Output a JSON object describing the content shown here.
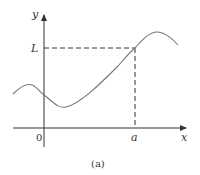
{
  "figure": {
    "caption": "(a)",
    "axes": {
      "x_label": "x",
      "y_label": "y",
      "origin_label": "0"
    },
    "marked_point": {
      "x_label": "a",
      "y_label": "L"
    },
    "colors": {
      "axis": "#333333",
      "curve": "#777777",
      "dashed": "#333333",
      "background": "#ffffff"
    }
  }
}
